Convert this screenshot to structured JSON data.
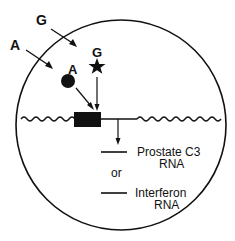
{
  "diagram": {
    "type": "cell-hormone-gene-activation",
    "colors": {
      "ink": "#111111",
      "background": "#ffffff"
    },
    "labels": {
      "outer_A": "A",
      "outer_G": "G",
      "inner_A": "A",
      "inner_G": "G",
      "output_1_line1": "Prostate C3",
      "output_1_line2": "RNA",
      "connector": "or",
      "output_2_line1": "Interferon",
      "output_2_line2": "RNA"
    },
    "shapes": {
      "cell": "circle",
      "hormone_A": "filled-circle",
      "hormone_G": "star",
      "gene": "filled-rectangle",
      "dna": "wavy-line"
    }
  }
}
